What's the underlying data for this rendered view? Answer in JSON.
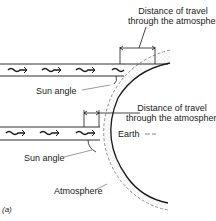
{
  "figure": {
    "panel_label": "(a)",
    "labels": {
      "distance_top_line1": "Distance of travel",
      "distance_top_line2": "through the atmosphere",
      "distance_bottom_line1": "Distance of travel",
      "distance_bottom_line2": "through the atmosphere",
      "sun_angle_top": "Sun angle",
      "sun_angle_bottom": "Sun angle",
      "earth": "Earth",
      "atmosphere": "Atmosphere"
    },
    "elements": {
      "sun_beams": [
        {
          "name": "upper-sun-beam",
          "description": "horizontal beam with wavy arrows, tangential incidence"
        },
        {
          "name": "lower-sun-beam",
          "description": "horizontal beam with wavy arrows, near-direct incidence"
        }
      ],
      "earth_surface": "curved solid arc",
      "atmosphere_layer": "stippled band with dashed outer edge"
    },
    "colors": {
      "line": "#1a1a1a",
      "stipple": "#9a9a9a",
      "background": "#ffffff"
    }
  }
}
